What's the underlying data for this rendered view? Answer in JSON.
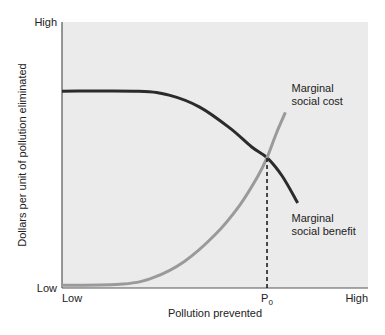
{
  "chart_data": {
    "type": "line",
    "title": "",
    "xlabel": "Pollution prevented",
    "ylabel": "Dollars per unit of pollution eliminated",
    "x_ticks": [
      {
        "label": "Low",
        "value": 0
      },
      {
        "label": "P",
        "sub": "0",
        "value": 0.67
      },
      {
        "label": "High",
        "value": 1
      }
    ],
    "y_ticks": [
      {
        "label": "Low",
        "value": 0
      },
      {
        "label": "High",
        "value": 1
      }
    ],
    "xlim": [
      0,
      1
    ],
    "ylim": [
      0,
      1
    ],
    "grid": false,
    "background": "#ebebeb",
    "series": [
      {
        "name": "Marginal social benefit",
        "label_lines": [
          "Marginal",
          "social benefit"
        ],
        "color": "#2b2b2b",
        "points": [
          [
            0,
            0.74
          ],
          [
            0.25,
            0.74
          ],
          [
            0.35,
            0.725
          ],
          [
            0.45,
            0.68
          ],
          [
            0.55,
            0.6
          ],
          [
            0.62,
            0.53
          ],
          [
            0.67,
            0.49
          ],
          [
            0.72,
            0.42
          ],
          [
            0.77,
            0.32
          ]
        ]
      },
      {
        "name": "Marginal social cost",
        "label_lines": [
          "Marginal",
          "social cost"
        ],
        "color": "#9a9a9a",
        "points": [
          [
            0,
            0.01
          ],
          [
            0.2,
            0.015
          ],
          [
            0.3,
            0.04
          ],
          [
            0.4,
            0.1
          ],
          [
            0.5,
            0.2
          ],
          [
            0.58,
            0.31
          ],
          [
            0.64,
            0.42
          ],
          [
            0.67,
            0.49
          ],
          [
            0.7,
            0.58
          ],
          [
            0.73,
            0.66
          ]
        ]
      }
    ],
    "annotations": [
      {
        "type": "vline-dashed",
        "x": 0.67,
        "from_y": 0,
        "to_y": 0.49,
        "label": "P0"
      }
    ]
  }
}
